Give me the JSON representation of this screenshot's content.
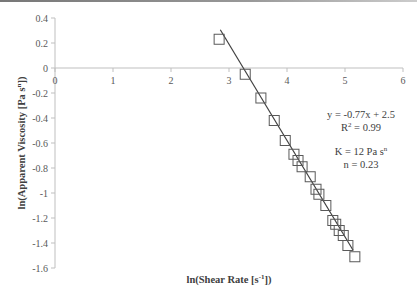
{
  "chart_data": {
    "type": "scatter",
    "title": "",
    "xlabel": "ln(Shear Rate [s-1])",
    "xlabel_parts": {
      "pre": "ln(Shear Rate [s",
      "sup": "-1",
      "post": "])"
    },
    "ylabel": "ln(Apparent Viscosity [Pa s^n])",
    "ylabel_parts": {
      "pre": "ln(Apparent Viscosity [Pa s",
      "sup": "n",
      "post": "])"
    },
    "xlim": [
      0,
      6
    ],
    "ylim": [
      -1.6,
      0.4
    ],
    "x_ticks": [
      "0",
      "1",
      "2",
      "3",
      "4",
      "5",
      "6"
    ],
    "y_ticks": [
      "0.4",
      "0.2",
      "0",
      "-0.2",
      "-0.4",
      "-0.6",
      "-0.8",
      "-1",
      "-1.2",
      "-1.4",
      "-1.6"
    ],
    "grid": false,
    "legend": null,
    "series": [
      {
        "name": "Data",
        "marker": "open-square",
        "x": [
          2.83,
          3.28,
          3.55,
          3.78,
          3.97,
          4.12,
          4.19,
          4.26,
          4.4,
          4.5,
          4.55,
          4.67,
          4.79,
          4.84,
          4.9,
          4.97,
          5.05,
          5.17
        ],
        "y": [
          0.23,
          -0.05,
          -0.24,
          -0.42,
          -0.58,
          -0.69,
          -0.74,
          -0.79,
          -0.87,
          -0.97,
          -1.01,
          -1.1,
          -1.22,
          -1.25,
          -1.3,
          -1.34,
          -1.42,
          -1.51
        ]
      }
    ],
    "trendline": {
      "type": "linear",
      "slope": -0.77,
      "intercept": 2.5,
      "x_range": [
        2.85,
        5.14
      ],
      "equation": "y = -0.77x + 2.5",
      "r2": "0.99"
    },
    "annotations": [
      {
        "text": "y = -0.77x + 2.5"
      },
      {
        "text": "R2 = 0.99",
        "pre": "R",
        "sup": "2",
        "post": " = 0.99"
      },
      {
        "text": "K = 12 Pa s^n",
        "pre": "K = 12 Pa s",
        "sup": "n",
        "post": ""
      },
      {
        "text": "n = 0.23"
      }
    ]
  },
  "colors": {
    "axis": "#bfbfbf",
    "marker": "#595959",
    "trendline": "#404040",
    "text": "#404040"
  }
}
